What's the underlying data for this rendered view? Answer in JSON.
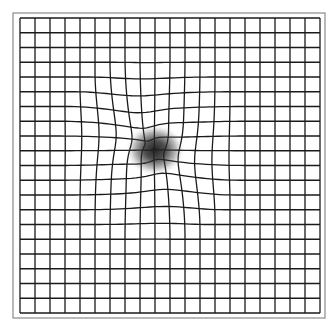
{
  "figure": {
    "type": "amsler-grid",
    "canvas": {
      "width": 335,
      "height": 329
    },
    "outer_frame": {
      "x": 13,
      "y": 13,
      "width": 312,
      "height": 305,
      "stroke": "#8a8a8a",
      "stroke_width": 1.2
    },
    "grid": {
      "x": 20,
      "y": 18,
      "width": 300,
      "height": 295,
      "columns": 20,
      "rows": 20,
      "stroke": "#1a1a1a",
      "stroke_width": 1.3
    },
    "distortion": {
      "center_x": 152,
      "center_y": 148,
      "radius": 95,
      "strength": 0.38
    },
    "blur_spot": {
      "center_x": 155,
      "center_y": 150,
      "radius_x": 30,
      "radius_y": 26,
      "color": "#303030"
    }
  }
}
